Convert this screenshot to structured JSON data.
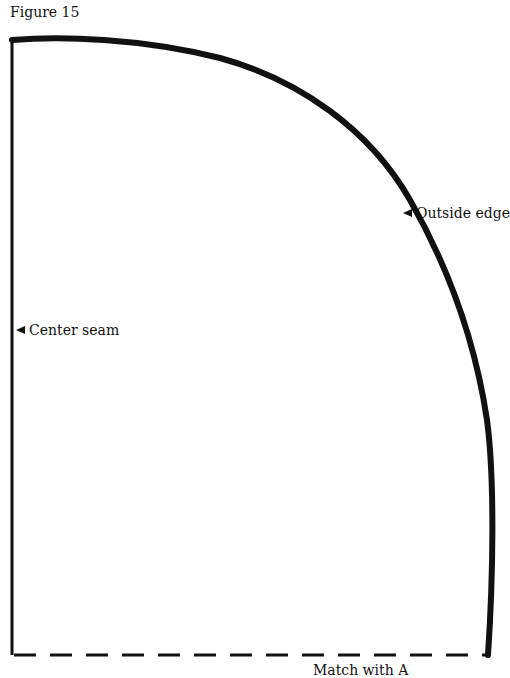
{
  "figure": {
    "title": "Figure 15",
    "labels": {
      "outside_edge": "Outside edge",
      "center_seam": "Center seam",
      "match": "Match with A"
    },
    "colors": {
      "line": "#111111",
      "background": "#ffffff"
    }
  }
}
